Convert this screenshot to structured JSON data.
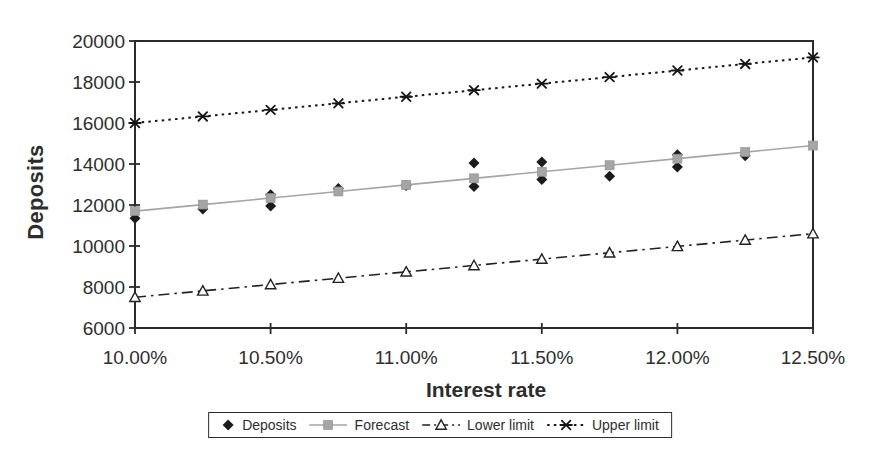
{
  "chart_data": {
    "type": "line",
    "title": "",
    "xlabel": "Interest rate",
    "ylabel": "Deposits",
    "xlim": [
      10.0,
      12.5
    ],
    "ylim": [
      6000,
      20000
    ],
    "y_ticks": [
      6000,
      8000,
      10000,
      12000,
      14000,
      16000,
      18000,
      20000
    ],
    "x_ticks": [
      10.0,
      10.5,
      11.0,
      11.5,
      12.0,
      12.5
    ],
    "x_tick_labels": [
      "10.00%",
      "10.50%",
      "11.00%",
      "11.50%",
      "12.00%",
      "12.50%"
    ],
    "grid": false,
    "legend_position": "bottom",
    "frame_color": "#2b2b2b",
    "x_points": [
      10.0,
      10.25,
      10.5,
      10.75,
      11.0,
      11.25,
      11.5,
      11.75,
      12.0,
      12.25,
      12.5
    ],
    "series": [
      {
        "name": "Deposits",
        "type": "scatter",
        "marker": "diamond",
        "color": "#1b1b1b",
        "points": [
          [
            10.0,
            11350
          ],
          [
            10.25,
            11800
          ],
          [
            10.5,
            12500
          ],
          [
            10.5,
            11950
          ],
          [
            10.75,
            12800
          ],
          [
            11.0,
            12950
          ],
          [
            11.25,
            14050
          ],
          [
            11.25,
            12900
          ],
          [
            11.5,
            14100
          ],
          [
            11.5,
            13250
          ],
          [
            11.75,
            13400
          ],
          [
            12.0,
            14450
          ],
          [
            12.0,
            13850
          ],
          [
            12.25,
            14400
          ]
        ]
      },
      {
        "name": "Forecast",
        "type": "line",
        "line_style": "solid",
        "marker": "square",
        "color": "#a5a5a5",
        "values": [
          11700,
          12020,
          12340,
          12660,
          12980,
          13300,
          13620,
          13940,
          14260,
          14580,
          14900
        ]
      },
      {
        "name": "Lower limit",
        "type": "line",
        "line_style": "dashdot",
        "marker": "triangle-open",
        "color": "#222222",
        "values": [
          7500,
          7810,
          8120,
          8430,
          8740,
          9050,
          9360,
          9670,
          9980,
          10290,
          10600
        ]
      },
      {
        "name": "Upper limit",
        "type": "line",
        "line_style": "dotted",
        "marker": "star",
        "color": "#161616",
        "values": [
          16000,
          16320,
          16640,
          16960,
          17280,
          17600,
          17920,
          18240,
          18560,
          18880,
          19200
        ]
      }
    ]
  }
}
